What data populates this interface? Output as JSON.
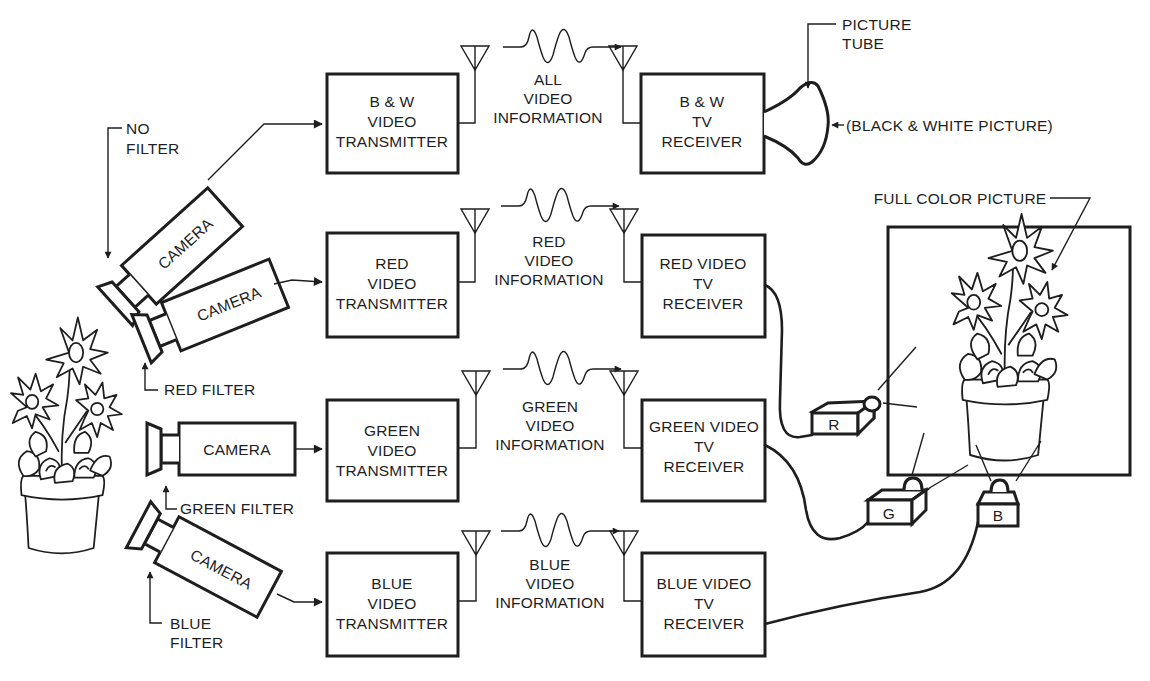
{
  "diagram": {
    "type": "block-diagram",
    "ink_color": "#1e1e1e",
    "background": "#ffffff"
  },
  "cameras": [
    {
      "id": "cam_bw",
      "label": "CAMERA",
      "filter": [
        "NO",
        "FILTER"
      ]
    },
    {
      "id": "cam_red",
      "label": "CAMERA",
      "filter": [
        "RED FILTER"
      ]
    },
    {
      "id": "cam_green",
      "label": "CAMERA",
      "filter": [
        "GREEN FILTER"
      ]
    },
    {
      "id": "cam_blue",
      "label": "CAMERA",
      "filter": [
        "BLUE",
        "FILTER"
      ]
    }
  ],
  "transmitters": [
    {
      "lines": [
        "B & W",
        "VIDEO",
        "TRANSMITTER"
      ]
    },
    {
      "lines": [
        "RED",
        "VIDEO",
        "TRANSMITTER"
      ]
    },
    {
      "lines": [
        "GREEN",
        "VIDEO",
        "TRANSMITTER"
      ]
    },
    {
      "lines": [
        "BLUE",
        "VIDEO",
        "TRANSMITTER"
      ]
    }
  ],
  "signals": [
    {
      "lines": [
        "ALL",
        "VIDEO",
        "INFORMATION"
      ]
    },
    {
      "lines": [
        "RED",
        "VIDEO",
        "INFORMATION"
      ]
    },
    {
      "lines": [
        "GREEN",
        "VIDEO",
        "INFORMATION"
      ]
    },
    {
      "lines": [
        "BLUE",
        "VIDEO",
        "INFORMATION"
      ]
    }
  ],
  "receivers": [
    {
      "lines": [
        "B & W",
        "TV",
        "RECEIVER"
      ]
    },
    {
      "lines": [
        "RED VIDEO",
        "TV",
        "RECEIVER"
      ]
    },
    {
      "lines": [
        "GREEN VIDEO",
        "TV",
        "RECEIVER"
      ]
    },
    {
      "lines": [
        "BLUE VIDEO",
        "TV",
        "RECEIVER"
      ]
    }
  ],
  "picture_tube": {
    "label": [
      "PICTURE",
      "TUBE"
    ],
    "output": "(BLACK & WHITE PICTURE)"
  },
  "projectors": [
    {
      "label": "R",
      "color_name": "red"
    },
    {
      "label": "G",
      "color_name": "green"
    },
    {
      "label": "B",
      "color_name": "blue"
    }
  ],
  "screen": {
    "label": "FULL COLOR PICTURE"
  }
}
